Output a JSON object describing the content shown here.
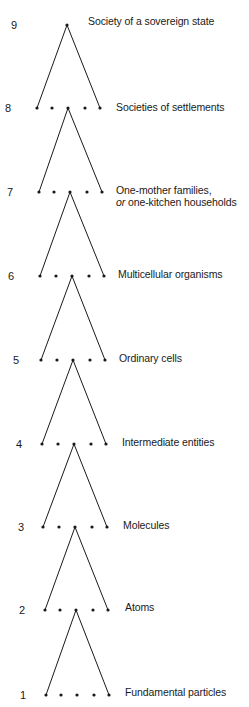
{
  "diagram": {
    "type": "hierarchy-of-levels",
    "line_color": "#1a1a1a",
    "dot_color": "#1a1a1a",
    "levels": [
      {
        "number": "9",
        "label": "Society of a sovereign state",
        "label_line2_em": "",
        "label_line2": "",
        "y": 25,
        "dots_x": [
          67
        ],
        "apex_x": null,
        "num_x": 14,
        "label_x": 88,
        "label_y": 15
      },
      {
        "number": "8",
        "label": "Societies of settlements",
        "label_line2_em": "",
        "label_line2": "",
        "y": 108,
        "dots_x": [
          37,
          52,
          68,
          85,
          100
        ],
        "apex_x": 68,
        "num_x": 8,
        "label_x": 116,
        "label_y": 101
      },
      {
        "number": "7",
        "label": "One-mother families,",
        "label_line2_em": "or",
        "label_line2": " one-kitchen households",
        "y": 192,
        "dots_x": [
          39,
          54,
          70,
          87,
          102
        ],
        "apex_x": 70,
        "num_x": 10,
        "label_x": 116,
        "label_y": 184
      },
      {
        "number": "6",
        "label": "Multicellular organisms",
        "label_line2_em": "",
        "label_line2": "",
        "y": 276,
        "dots_x": [
          40,
          56,
          72,
          89,
          104
        ],
        "apex_x": 72,
        "num_x": 11,
        "label_x": 118,
        "label_y": 268
      },
      {
        "number": "5",
        "label": "Ordinary cells",
        "label_line2_em": "",
        "label_line2": "",
        "y": 360,
        "dots_x": [
          41,
          57,
          73,
          90,
          105
        ],
        "apex_x": 73,
        "num_x": 16,
        "label_x": 119,
        "label_y": 352
      },
      {
        "number": "4",
        "label": "Intermediate entities",
        "label_line2_em": "",
        "label_line2": "",
        "y": 444,
        "dots_x": [
          42,
          58,
          74,
          91,
          106
        ],
        "apex_x": 74,
        "num_x": 19,
        "label_x": 122,
        "label_y": 436
      },
      {
        "number": "3",
        "label": "Molecules",
        "label_line2_em": "",
        "label_line2": "",
        "y": 527,
        "dots_x": [
          43,
          59,
          75,
          92,
          107
        ],
        "apex_x": 75,
        "num_x": 21,
        "label_x": 123,
        "label_y": 519
      },
      {
        "number": "2",
        "label": "Atoms",
        "label_line2_em": "",
        "label_line2": "",
        "y": 610,
        "dots_x": [
          45,
          60,
          76,
          93,
          108
        ],
        "apex_x": 76,
        "num_x": 22,
        "label_x": 125,
        "label_y": 601
      },
      {
        "number": "1",
        "label": "Fundamental particles",
        "label_line2_em": "",
        "label_line2": "",
        "y": 695,
        "dots_x": [
          46,
          61,
          77,
          94,
          109
        ],
        "apex_x": 77,
        "num_x": 23,
        "label_x": 125,
        "label_y": 686
      }
    ]
  }
}
